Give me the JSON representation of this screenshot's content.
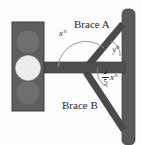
{
  "figure": {
    "colors": {
      "background": "#fdfdfd",
      "pole": "#5a5a5a",
      "arm": "#4f4f4f",
      "brace": "#4a4a4a",
      "housing": "#5e5e5e",
      "lamp_off": "#6e6e6e",
      "lamp_on": "#ededed",
      "arc": "#8a8a8a",
      "text": "#2b2b2b"
    },
    "labels": {
      "brace_a": "Brace A",
      "brace_b": "Brace B",
      "angle_x": "x°",
      "angle_y": "y°",
      "angle_fraction_numerator": "2",
      "angle_fraction_denominator": "5",
      "angle_fraction_variable": "x°"
    },
    "parts": {
      "pole": "vertical-pole",
      "arm": "horizontal-arm",
      "brace_upper": "brace-a-upper-diagonal",
      "brace_lower": "brace-b-lower-diagonal",
      "signal_housing": "traffic-light-housing",
      "lamp_top": "lamp-top",
      "lamp_middle": "lamp-middle",
      "lamp_bottom": "lamp-bottom"
    }
  }
}
